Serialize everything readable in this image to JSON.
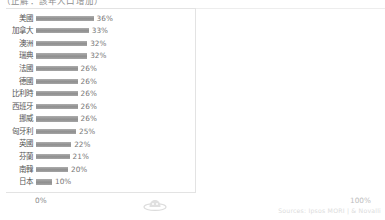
{
  "chart_data": {
    "type": "bar",
    "orientation": "horizontal",
    "title": "（正解：該年人口增加）",
    "xlabel": "",
    "ylabel": "",
    "xlim": [
      0,
      100
    ],
    "grid": false,
    "legend": "none",
    "value_suffix": "%",
    "categories": [
      "美國",
      "加拿大",
      "澳洲",
      "瑞典",
      "法國",
      "德國",
      "比利時",
      "西班牙",
      "挪威",
      "匈牙利",
      "英國",
      "芬蘭",
      "南韓",
      "日本"
    ],
    "values": [
      36,
      33,
      32,
      32,
      26,
      26,
      26,
      26,
      26,
      25,
      22,
      21,
      20,
      10
    ],
    "value_labels": [
      "36%",
      "33%",
      "32%",
      "32%",
      "26%",
      "26%",
      "26%",
      "26%",
      "26%",
      "25%",
      "22%",
      "21%",
      "20%",
      "10%"
    ],
    "bar_color": "#9a9a9a",
    "axis": {
      "min_label": "0%",
      "max_label": "100%"
    },
    "source": "Sources: Ipsos MORI | & Novalli"
  },
  "watermark": {
    "icon": "logo-watermark-icon"
  }
}
